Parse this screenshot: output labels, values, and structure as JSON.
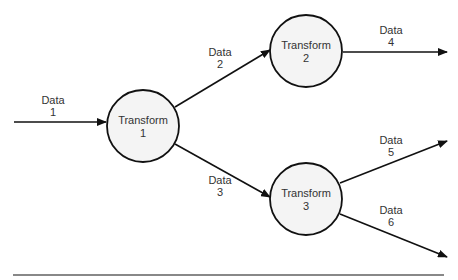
{
  "diagram": {
    "type": "data-flow",
    "nodes": [
      {
        "id": "t1",
        "label": "Transform",
        "number": "1"
      },
      {
        "id": "t2",
        "label": "Transform",
        "number": "2"
      },
      {
        "id": "t3",
        "label": "Transform",
        "number": "3"
      }
    ],
    "edges": [
      {
        "id": "d1",
        "label": "Data",
        "number": "1",
        "from": "",
        "to": "t1"
      },
      {
        "id": "d2",
        "label": "Data",
        "number": "2",
        "from": "t1",
        "to": "t2"
      },
      {
        "id": "d3",
        "label": "Data",
        "number": "3",
        "from": "t1",
        "to": "t3"
      },
      {
        "id": "d4",
        "label": "Data",
        "number": "4",
        "from": "t2",
        "to": ""
      },
      {
        "id": "d5",
        "label": "Data",
        "number": "5",
        "from": "t3",
        "to": ""
      },
      {
        "id": "d6",
        "label": "Data",
        "number": "6",
        "from": "t3",
        "to": ""
      }
    ],
    "colors": {
      "stroke": "#111111",
      "node_fill": "#f4f4f4",
      "rule": "#888888"
    }
  }
}
